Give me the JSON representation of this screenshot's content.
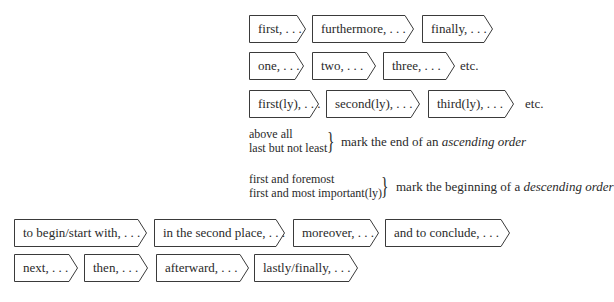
{
  "colors": {
    "background": "#ffffff",
    "text": "#2a2a2a",
    "border": "#3a3a3a"
  },
  "rows": {
    "row1": {
      "items": [
        "first, . . .",
        "furthermore, . . .",
        "finally, . . ."
      ]
    },
    "row2": {
      "items": [
        "one, . . .",
        "two, . . .",
        "three, . . ."
      ],
      "etc": "etc."
    },
    "row3": {
      "items": [
        "first(ly), . . .",
        "second(ly), . . .",
        "third(ly), . . ."
      ],
      "etc": "etc."
    },
    "ascending": {
      "lines": [
        "above all",
        "last but not least"
      ],
      "brace": "}",
      "note_prefix": "mark the end of an ",
      "note_emph": "ascending order"
    },
    "descending": {
      "lines": [
        "first and foremost",
        "first and most important(ly)"
      ],
      "brace": "}",
      "note_prefix": "mark the beginning of a ",
      "note_emph": "descending order"
    },
    "row4": {
      "items": [
        "to begin/start with, . . .",
        "in the second place, . . .",
        "moreover, . . .",
        "and to conclude, . . ."
      ]
    },
    "row5": {
      "items": [
        "next, . . .",
        "then, . . .",
        "afterward, . . .",
        "lastly/finally, . . ."
      ]
    }
  }
}
